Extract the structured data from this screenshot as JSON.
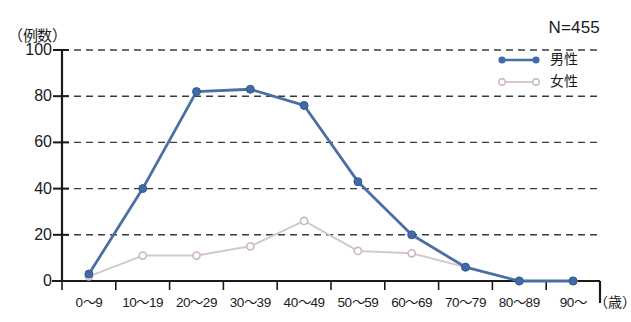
{
  "chart_data": {
    "type": "line",
    "title": "",
    "subtitle": "",
    "xlabel": "（歳）",
    "ylabel": "（例数）",
    "ylim": [
      0,
      100
    ],
    "yticks": [
      0,
      20,
      40,
      60,
      80,
      100
    ],
    "grid": true,
    "grid_style": "dashed-horizontal",
    "legend_position": "top-right",
    "annotation": "N=455",
    "categories": [
      "0〜9",
      "10〜19",
      "20〜29",
      "30〜39",
      "40〜49",
      "50〜59",
      "60〜69",
      "70〜79",
      "80〜89",
      "90〜"
    ],
    "series": [
      {
        "name": "男性",
        "color": "#4A6FA5",
        "marker": "circle",
        "line_style": "solid",
        "values": [
          3,
          40,
          82,
          83,
          76,
          43,
          20,
          6,
          0,
          0
        ]
      },
      {
        "name": "女性",
        "color": "#D6C6CE",
        "marker": "circle-open",
        "line_style": "solid-light",
        "values": [
          2,
          11,
          11,
          15,
          26,
          13,
          12,
          6,
          0,
          0
        ]
      }
    ]
  },
  "axis": {
    "y_unit_label": "（例数）",
    "x_unit_label": "（歳）"
  },
  "legend": {
    "items": [
      {
        "label": "男性"
      },
      {
        "label": "女性"
      }
    ]
  },
  "annotations": {
    "sample_size": "N=455"
  },
  "colors": {
    "male": "#4A6FA5",
    "female": "#D6C6CE",
    "axis": "#1a1a1a",
    "grid": "#3a3a3a",
    "background": "#ffffff"
  }
}
